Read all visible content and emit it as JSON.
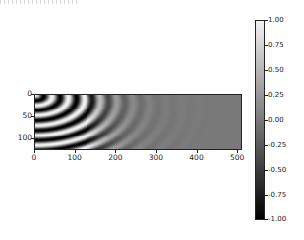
{
  "chart_data": {
    "type": "heatmap",
    "title": "",
    "xlabel": "",
    "ylabel": "",
    "x_range": [
      0,
      512
    ],
    "y_range": [
      0,
      128
    ],
    "y_inverted": true,
    "x_ticks": [
      0,
      100,
      200,
      300,
      400,
      500
    ],
    "y_ticks": [
      0,
      50,
      100
    ],
    "colormap": "gray",
    "color_range": [
      -1.0,
      1.0
    ],
    "colorbar_ticks": [
      "1.00",
      "0.75",
      "0.50",
      "0.25",
      "0.00",
      "-0.25",
      "-0.50",
      "-0.75",
      "-1.00"
    ]
  },
  "axes": {
    "x_ticks": [
      "0",
      "100",
      "200",
      "300",
      "400",
      "500"
    ],
    "y_ticks": [
      "0",
      "50",
      "100"
    ]
  },
  "colorbar": {
    "ticks": [
      "1.00",
      "0.75",
      "0.50",
      "0.25",
      "0.00",
      "-0.25",
      "-0.50",
      "-0.75",
      "-1.00"
    ]
  }
}
